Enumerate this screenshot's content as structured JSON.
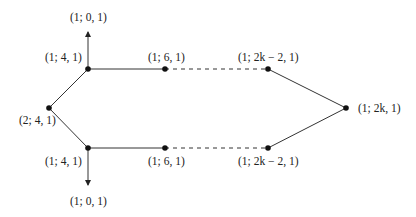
{
  "diagram": {
    "nodes": [
      {
        "id": "top-left",
        "label": "(1; 4, 1)",
        "x": 88,
        "y": 69
      },
      {
        "id": "top-mid",
        "label": "(1; 6, 1)",
        "x": 165,
        "y": 69
      },
      {
        "id": "top-right",
        "label": "(1; 2k − 2, 1)",
        "x": 268,
        "y": 69
      },
      {
        "id": "right",
        "label": "(1; 2k, 1)",
        "x": 346,
        "y": 108
      },
      {
        "id": "left",
        "label": "(2; 4, 1)",
        "x": 49,
        "y": 108
      },
      {
        "id": "bottom-left",
        "label": "(1; 4, 1)",
        "x": 88,
        "y": 148
      },
      {
        "id": "bottom-mid",
        "label": "(1; 6, 1)",
        "x": 165,
        "y": 148
      },
      {
        "id": "bottom-right",
        "label": "(1; 2k − 2, 1)",
        "x": 268,
        "y": 148
      }
    ],
    "arrow_labels": {
      "top": "(1; 0, 1)",
      "bottom": "(1; 0, 1)"
    },
    "edges": [
      {
        "from": "left",
        "to": "top-left",
        "style": "solid"
      },
      {
        "from": "left",
        "to": "bottom-left",
        "style": "solid"
      },
      {
        "from": "top-left",
        "to": "top-mid",
        "style": "solid"
      },
      {
        "from": "top-mid",
        "to": "top-right",
        "style": "dashed"
      },
      {
        "from": "top-right",
        "to": "right",
        "style": "solid"
      },
      {
        "from": "bottom-left",
        "to": "bottom-mid",
        "style": "solid"
      },
      {
        "from": "bottom-mid",
        "to": "bottom-right",
        "style": "dashed"
      },
      {
        "from": "bottom-right",
        "to": "right",
        "style": "solid"
      },
      {
        "from": "top-left",
        "to": "arrow-up",
        "style": "arrow"
      },
      {
        "from": "bottom-left",
        "to": "arrow-down",
        "style": "arrow"
      }
    ]
  }
}
